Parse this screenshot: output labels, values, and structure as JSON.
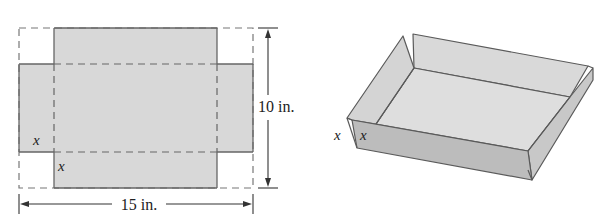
{
  "net_diagram": {
    "width_label": "15 in.",
    "height_label": "10 in.",
    "cut_label_side": "x",
    "cut_label_bottom": "x"
  },
  "box_diagram": {
    "height_label_outer": "x",
    "height_label_inner": "x"
  },
  "colors": {
    "fill": "#d8d8d8",
    "front_wall": "#bcbcbc",
    "side_wall": "#cacaca",
    "inside": "#dedede",
    "line": "#555555"
  }
}
